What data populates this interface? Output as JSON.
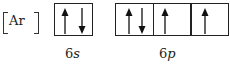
{
  "core": {
    "symbol": "Ar"
  },
  "orbitals": [
    {
      "label_n": "6",
      "label_l": "s",
      "boxes": [
        [
          "up",
          "down"
        ]
      ]
    },
    {
      "label_n": "6",
      "label_l": "p",
      "boxes": [
        [
          "up",
          "down"
        ],
        [
          "up"
        ],
        [
          "up"
        ]
      ]
    }
  ]
}
